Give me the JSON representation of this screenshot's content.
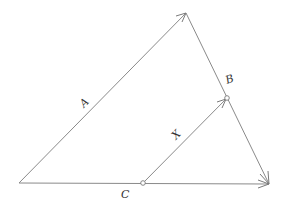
{
  "diagram": {
    "type": "vector-triangle",
    "colors": {
      "line": "#8a8a8a",
      "label": "#333333",
      "background": "#ffffff"
    },
    "points": {
      "origin": [
        19,
        183
      ],
      "top": [
        186,
        13
      ],
      "right": [
        269,
        184
      ],
      "c_point": [
        143,
        183
      ],
      "b_point": [
        227,
        98
      ]
    },
    "vectors": [
      {
        "name": "A",
        "from": "origin",
        "to": "top"
      },
      {
        "name": "C",
        "from": "origin",
        "to": "right"
      },
      {
        "name": "top-to-right",
        "from": "top",
        "to": "right"
      },
      {
        "name": "X",
        "from": "c_point",
        "to": "b_point"
      }
    ],
    "labels": {
      "a": "A",
      "b": "B",
      "c": "C",
      "x": "X"
    }
  }
}
